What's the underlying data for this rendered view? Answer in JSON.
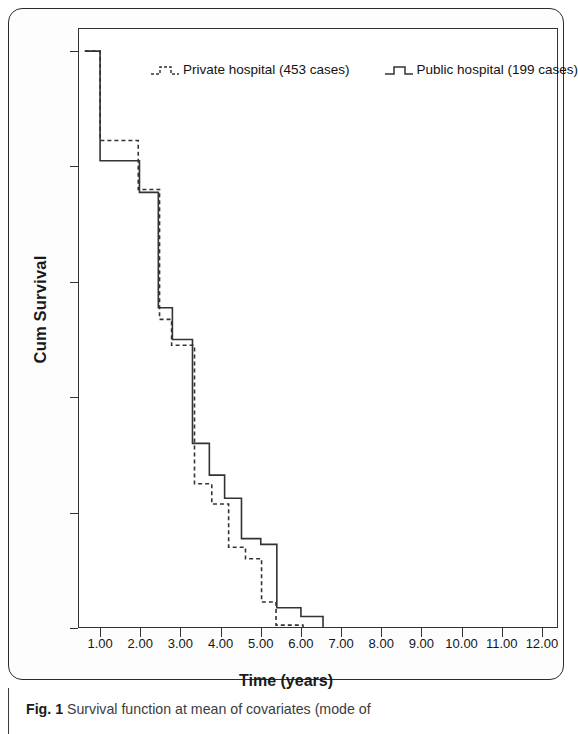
{
  "figure": {
    "caption_label": "Fig. 1",
    "caption_text": "Survival function at mean of covariates (mode of"
  },
  "axes": {
    "y_title": "Cum Survival",
    "x_title": "Time (years)",
    "y_ticks": [
      "0.0",
      "0.2",
      "0.4",
      "0.6",
      "0.8",
      "1.0"
    ],
    "x_ticks": [
      "1.00",
      "2.00",
      "3.00",
      "4.00",
      "5.00",
      "6.00",
      "7.00",
      "8.00",
      "9.00",
      "10.00",
      "11.00",
      "12.00"
    ]
  },
  "legend": {
    "entries": [
      {
        "label": "Private hospital (453 cases)",
        "style": "dashed",
        "icon": "step-line-dashed-icon"
      },
      {
        "label": "Public hospital (199 cases)",
        "style": "solid",
        "icon": "step-line-solid-icon"
      }
    ]
  },
  "colors": {
    "line": "#333333",
    "frame": "#333333",
    "text": "#151515",
    "caption": "#3c3c3c"
  },
  "chart_data": {
    "type": "line",
    "subtype": "kaplan-meier-step",
    "title": "Survival function at mean of covariates",
    "xlabel": "Time (years)",
    "ylabel": "Cum Survival",
    "xlim": [
      0.45,
      12.4
    ],
    "ylim": [
      0.0,
      1.04
    ],
    "grid": false,
    "legend_position": "top-center",
    "series": [
      {
        "name": "Private hospital (453 cases)",
        "n_cases": 453,
        "style": "dashed",
        "x": [
          0.62,
          1.0,
          1.0,
          1.95,
          1.95,
          2.48,
          2.48,
          2.78,
          2.78,
          3.02,
          3.02,
          3.35,
          3.35,
          3.78,
          3.78,
          4.2,
          4.2,
          4.62,
          4.62,
          5.02,
          5.02,
          5.38,
          5.38,
          6.05,
          6.05,
          11.0
        ],
        "y": [
          1.0,
          1.0,
          0.845,
          0.845,
          0.76,
          0.76,
          0.535,
          0.535,
          0.49,
          0.49,
          0.49,
          0.49,
          0.25,
          0.25,
          0.215,
          0.215,
          0.14,
          0.14,
          0.12,
          0.12,
          0.045,
          0.045,
          0.005,
          0.005,
          0.0,
          0.0
        ]
      },
      {
        "name": "Public hospital (199 cases)",
        "n_cases": 199,
        "style": "solid",
        "x": [
          0.62,
          1.0,
          1.0,
          1.98,
          1.98,
          2.45,
          2.45,
          2.8,
          2.8,
          3.3,
          3.3,
          3.72,
          3.72,
          4.1,
          4.1,
          4.52,
          4.52,
          5.0,
          5.0,
          5.4,
          5.4,
          6.0,
          6.0,
          6.55,
          6.55,
          7.0
        ],
        "y": [
          1.0,
          1.0,
          0.81,
          0.81,
          0.755,
          0.755,
          0.555,
          0.555,
          0.5,
          0.5,
          0.32,
          0.32,
          0.265,
          0.265,
          0.225,
          0.225,
          0.155,
          0.155,
          0.145,
          0.145,
          0.035,
          0.035,
          0.02,
          0.02,
          0.0,
          0.0
        ]
      }
    ]
  }
}
